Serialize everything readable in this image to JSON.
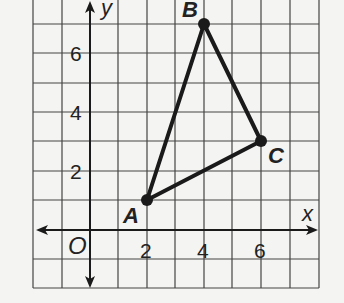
{
  "diagram": {
    "type": "coordinate-plane",
    "axes": {
      "x_label": "x",
      "y_label": "y",
      "origin_label": "O",
      "x_ticks": [
        "2",
        "4",
        "6"
      ],
      "y_ticks": [
        "2",
        "4",
        "6"
      ],
      "x_range": [
        -2,
        8
      ],
      "y_range": [
        -2,
        8
      ]
    },
    "triangle": {
      "vertices": [
        {
          "label": "A",
          "x": 2,
          "y": 1
        },
        {
          "label": "B",
          "x": 4,
          "y": 7
        },
        {
          "label": "C",
          "x": 6,
          "y": 3
        }
      ]
    },
    "colors": {
      "background": "#f4f4f2",
      "grid": "#444444",
      "ink": "#1a1a1a"
    }
  }
}
